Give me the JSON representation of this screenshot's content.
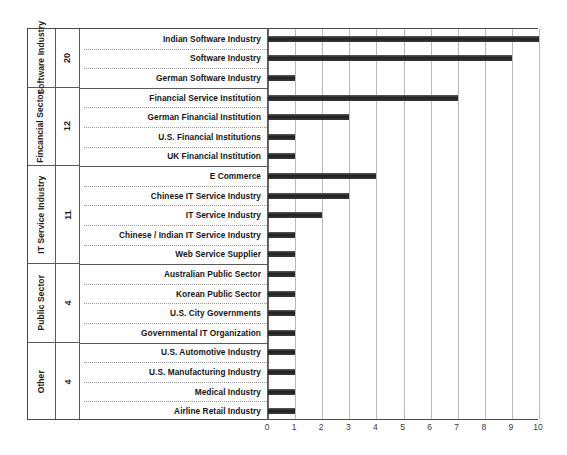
{
  "chart_data": {
    "type": "bar",
    "orientation": "horizontal",
    "title": "",
    "xlabel": "",
    "ylabel": "",
    "xlim": [
      0,
      10
    ],
    "xticks": [
      "0",
      "1",
      "2",
      "3",
      "4",
      "5",
      "6",
      "7",
      "8",
      "9",
      "10"
    ],
    "grid": true,
    "legend": "none",
    "categories": [
      "Indian Software Industry",
      "Software Industry",
      "German Software Industry",
      "Financial Service Institution",
      "German Financial Institution",
      "U.S. Financial Institutions",
      "UK Financial Institution",
      "E Commerce",
      "Chinese IT Service Industry",
      "IT Service Industry",
      "Chinese / Indian IT Service Industry",
      "Web Service Supplier",
      "Australian Public Sector",
      "Korean Public Sector",
      "U.S. City Governments",
      "Governmental IT Organization",
      "U.S. Automotive Industry",
      "U.S. Manufacturing Industry",
      "Medical Industry",
      "Airline Retail Industry"
    ],
    "values": [
      10,
      9,
      1,
      7,
      3,
      1,
      1,
      4,
      3,
      2,
      1,
      1,
      1,
      1,
      1,
      1,
      1,
      1,
      1,
      1
    ],
    "groups": [
      {
        "name": "Software Industry",
        "count": "20",
        "rows": 3
      },
      {
        "name": "Fincancial Sector",
        "count": "12",
        "rows": 4
      },
      {
        "name": "IT Service Industry",
        "count": "11",
        "rows": 5
      },
      {
        "name": "Public Sector",
        "count": "4",
        "rows": 4
      },
      {
        "name": "Other",
        "count": "4",
        "rows": 4
      }
    ],
    "bar_color": "#2e2e2e",
    "grid_color": "#b9b9b9",
    "axis_color": "#4a4a4a"
  }
}
